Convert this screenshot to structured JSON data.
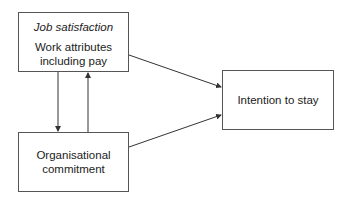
{
  "diagram": {
    "nodes": [
      {
        "id": "job_satisfaction",
        "title": "Job satisfaction",
        "lines": [
          "Work attributes",
          "including pay"
        ]
      },
      {
        "id": "organisational_commitment",
        "lines": [
          "Organisational",
          "commitment"
        ]
      },
      {
        "id": "intention_to_stay",
        "lines": [
          "Intention to stay"
        ]
      }
    ],
    "edges": [
      {
        "from": "job_satisfaction",
        "to": "organisational_commitment"
      },
      {
        "from": "organisational_commitment",
        "to": "job_satisfaction"
      },
      {
        "from": "job_satisfaction",
        "to": "intention_to_stay"
      },
      {
        "from": "organisational_commitment",
        "to": "intention_to_stay"
      }
    ]
  }
}
